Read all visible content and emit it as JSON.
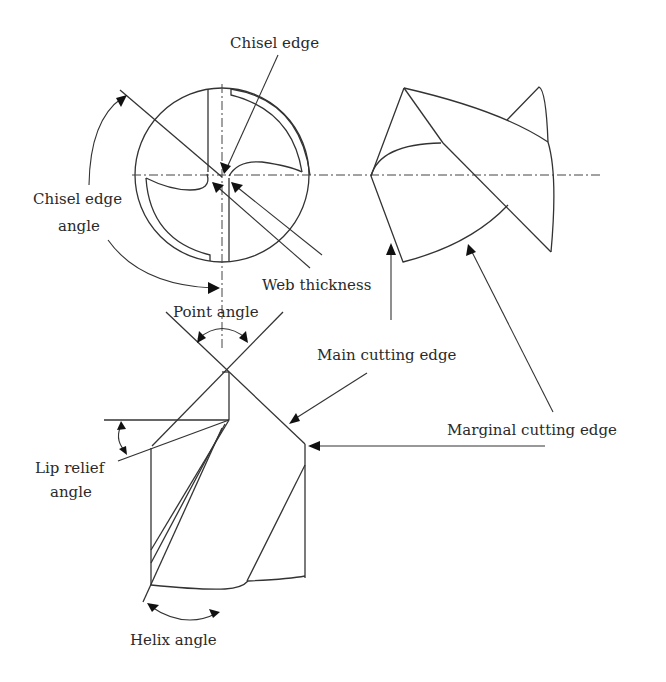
{
  "diagram": {
    "labels": {
      "chisel_edge": "Chisel edge",
      "chisel_edge_angle_line1": "Chisel edge",
      "chisel_edge_angle_line2": "angle",
      "web_thickness": "Web thickness",
      "point_angle": "Point angle",
      "main_cutting_edge": "Main cutting edge",
      "marginal_cutting_edge": "Marginal cutting edge",
      "lip_relief_angle_line1": "Lip relief",
      "lip_relief_angle_line2": "angle",
      "helix_angle": "Helix angle"
    },
    "views": [
      "end-view",
      "point-side-view",
      "body-side-view"
    ],
    "colors": {
      "line": "#333333",
      "text": "#2a2a2a",
      "background": "#ffffff"
    }
  }
}
